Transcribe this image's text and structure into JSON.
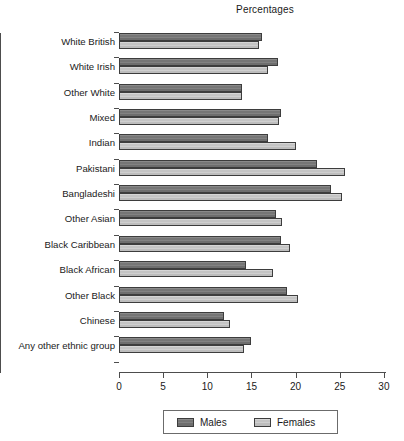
{
  "chart_data": {
    "type": "bar",
    "orientation": "horizontal",
    "title": "Percentages",
    "xlabel": "",
    "ylabel": "",
    "xlim": [
      0,
      30
    ],
    "xticks": [
      0,
      5,
      10,
      15,
      20,
      25,
      30
    ],
    "xtick_labels": [
      "0",
      "5",
      "10",
      "15",
      "20",
      "25",
      "30"
    ],
    "grid": false,
    "legend_position": "bottom",
    "categories": [
      "White British",
      "White Irish",
      "Other White",
      "Mixed",
      "Indian",
      "Pakistani",
      "Bangladeshi",
      "Other Asian",
      "Black Caribbean",
      "Black African",
      "Other Black",
      "Chinese",
      "Any other ethnic group"
    ],
    "series": [
      {
        "name": "Males",
        "color": "#7d7d7d",
        "values": [
          16.2,
          18.0,
          13.9,
          18.3,
          16.9,
          22.4,
          24.0,
          17.8,
          18.3,
          14.4,
          19.0,
          11.9,
          14.9
        ]
      },
      {
        "name": "Females",
        "color": "#c9c9c9",
        "values": [
          15.8,
          16.9,
          13.9,
          18.1,
          20.1,
          25.6,
          25.3,
          18.5,
          19.4,
          17.4,
          20.3,
          12.6,
          14.2
        ]
      }
    ],
    "legend": [
      "Males",
      "Females"
    ]
  }
}
